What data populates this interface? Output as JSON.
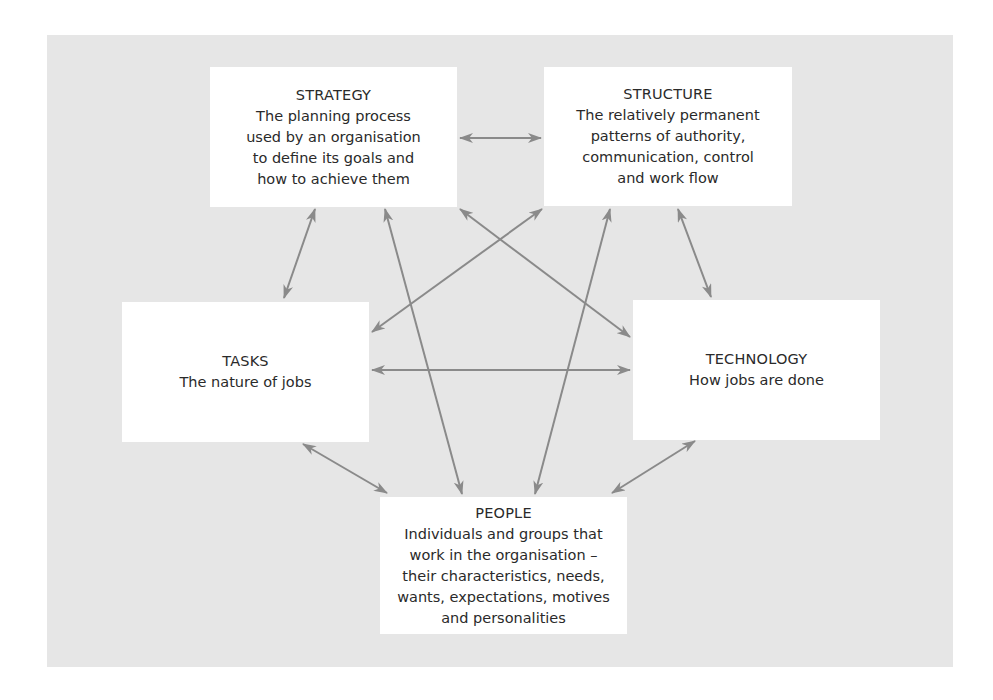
{
  "diagram": {
    "type": "interrelationship-diagram",
    "colors": {
      "panel": "#e6e6e6",
      "box": "#ffffff",
      "arrow": "#888888",
      "text": "#2a2a2a"
    },
    "nodes": {
      "strategy": {
        "title": "STRATEGY",
        "lines": [
          "The planning process",
          "used by an organisation",
          "to define its goals and",
          "how to achieve them"
        ]
      },
      "structure": {
        "title": "STRUCTURE",
        "lines": [
          "The relatively permanent",
          "patterns of authority,",
          "communication, control",
          "and work flow"
        ]
      },
      "tasks": {
        "title": "TASKS",
        "lines": [
          "The nature of jobs"
        ]
      },
      "technology": {
        "title": "TECHNOLOGY",
        "lines": [
          "How jobs are done"
        ]
      },
      "people": {
        "title": "PEOPLE",
        "lines": [
          "Individuals and groups that",
          "work in the organisation –",
          "their characteristics, needs,",
          "wants, expectations, motives",
          "and personalities"
        ]
      }
    },
    "edges": [
      {
        "from": "strategy",
        "to": "structure",
        "bidirectional": true
      },
      {
        "from": "strategy",
        "to": "tasks",
        "bidirectional": true
      },
      {
        "from": "strategy",
        "to": "people",
        "bidirectional": true
      },
      {
        "from": "strategy",
        "to": "technology",
        "bidirectional": true
      },
      {
        "from": "structure",
        "to": "tasks",
        "bidirectional": true
      },
      {
        "from": "structure",
        "to": "people",
        "bidirectional": true
      },
      {
        "from": "structure",
        "to": "technology",
        "bidirectional": true
      },
      {
        "from": "tasks",
        "to": "technology",
        "bidirectional": true
      },
      {
        "from": "tasks",
        "to": "people",
        "bidirectional": true
      },
      {
        "from": "technology",
        "to": "people",
        "bidirectional": true
      }
    ]
  }
}
